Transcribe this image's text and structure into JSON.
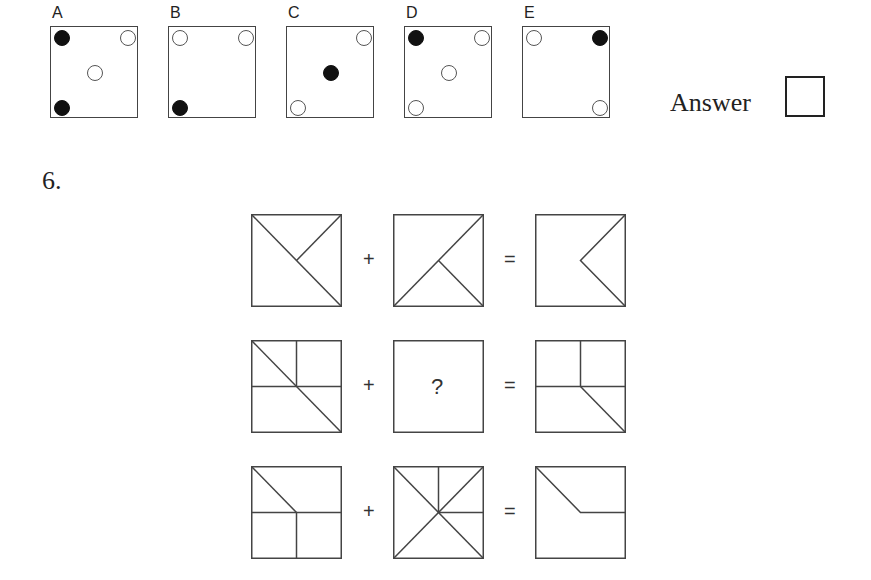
{
  "previous_question": {
    "options": [
      {
        "label": "A",
        "dots": [
          {
            "pos": "top-left",
            "fill": "filled"
          },
          {
            "pos": "top-right",
            "fill": "hollow"
          },
          {
            "pos": "center",
            "fill": "hollow"
          },
          {
            "pos": "bottom-left",
            "fill": "filled"
          }
        ]
      },
      {
        "label": "B",
        "dots": [
          {
            "pos": "top-left",
            "fill": "hollow"
          },
          {
            "pos": "top-right",
            "fill": "hollow"
          },
          {
            "pos": "bottom-left",
            "fill": "filled"
          }
        ]
      },
      {
        "label": "C",
        "dots": [
          {
            "pos": "top-right",
            "fill": "hollow"
          },
          {
            "pos": "center",
            "fill": "filled"
          },
          {
            "pos": "bottom-left",
            "fill": "hollow"
          }
        ]
      },
      {
        "label": "D",
        "dots": [
          {
            "pos": "top-left",
            "fill": "filled"
          },
          {
            "pos": "top-right",
            "fill": "hollow"
          },
          {
            "pos": "center",
            "fill": "hollow"
          },
          {
            "pos": "bottom-left",
            "fill": "hollow"
          }
        ]
      },
      {
        "label": "E",
        "dots": [
          {
            "pos": "top-left",
            "fill": "hollow"
          },
          {
            "pos": "top-right",
            "fill": "filled"
          },
          {
            "pos": "bottom-right",
            "fill": "hollow"
          }
        ]
      }
    ],
    "answer_label": "Answer",
    "answer_value": ""
  },
  "question": {
    "number": "6.",
    "plus_symbol": "+",
    "equals_symbol": "=",
    "unknown_symbol": "?",
    "rows": [
      {
        "left": [
          "diag-tl-br",
          "tr-center"
        ],
        "middle": [
          "diag-bl-tr",
          "center-br"
        ],
        "result": [
          "tr-center",
          "center-br"
        ]
      },
      {
        "left": [
          "diag-tl-br",
          "top-center",
          "horiz-full"
        ],
        "middle": "?",
        "result": [
          "top-center",
          "horiz-full",
          "center-br"
        ]
      },
      {
        "left": [
          "tl-center",
          "horiz-full",
          "center-bottom"
        ],
        "middle": [
          "diag-tl-br",
          "diag-bl-tr",
          "top-center",
          "center-right"
        ],
        "result": [
          "tl-center",
          "center-right"
        ]
      }
    ]
  },
  "colors": {
    "line": "#444444",
    "filled_dot": "#111111",
    "hollow_dot_border": "#555555",
    "background": "#ffffff"
  }
}
